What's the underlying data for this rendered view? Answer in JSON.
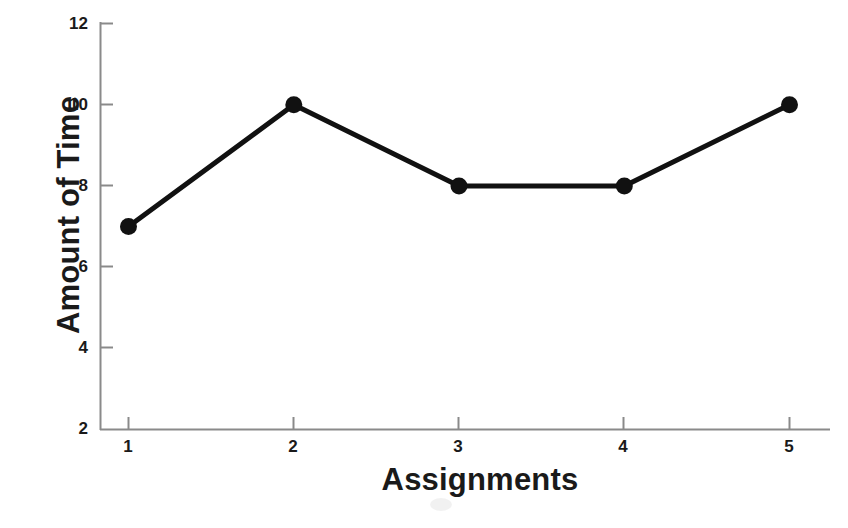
{
  "chart_data": {
    "type": "line",
    "title": "",
    "xlabel": "Assignments",
    "ylabel": "Amount of Time",
    "x": [
      1,
      2,
      3,
      4,
      5
    ],
    "values": [
      7,
      10,
      8,
      8,
      10
    ],
    "categories": [
      "1",
      "2",
      "3",
      "4",
      "5"
    ],
    "xtick_labels": [
      "1",
      "2",
      "3",
      "4",
      "5"
    ],
    "ytick_labels": [
      "12",
      "10",
      "8",
      "6",
      "4",
      "2"
    ],
    "yticks": [
      12,
      10,
      8,
      6,
      4,
      2
    ],
    "xlim": [
      0.62,
      5.3
    ],
    "ylim": [
      2,
      12
    ],
    "grid": false,
    "legend": null,
    "series": [
      {
        "name": "Amount of Time",
        "values": [
          7,
          10,
          8,
          8,
          10
        ],
        "marker": "filled-circle",
        "color": "#111111"
      }
    ],
    "points": [
      {
        "x": "1",
        "y": 7
      },
      {
        "x": "2",
        "y": 10
      },
      {
        "x": "3",
        "y": 8
      },
      {
        "x": "4",
        "y": 8
      },
      {
        "x": "5",
        "y": 10
      }
    ]
  },
  "style": {
    "line_color": "#111111",
    "marker_color": "#111111",
    "axis_color": "#8a8a8a",
    "text_color": "#1a1a1a",
    "background": "#ffffff"
  }
}
